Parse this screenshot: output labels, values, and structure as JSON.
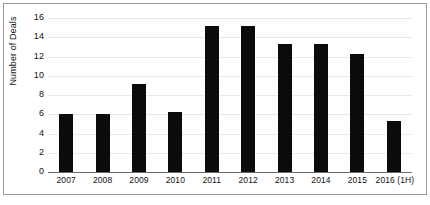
{
  "chart_data": {
    "type": "bar",
    "title": "",
    "xlabel": "",
    "ylabel": "Number of Deals",
    "categories": [
      "2007",
      "2008",
      "2009",
      "2010",
      "2011",
      "2012",
      "2013",
      "2014",
      "2015",
      "2016 (1H)"
    ],
    "values": [
      6,
      6,
      9.1,
      6.2,
      15.2,
      15.2,
      13.3,
      13.3,
      12.3,
      5.3
    ],
    "ylim": [
      0,
      16
    ],
    "ytick_labels": [
      "0",
      "2",
      "4",
      "6",
      "8",
      "10",
      "12",
      "14",
      "16"
    ],
    "ytick_values": [
      0,
      2,
      4,
      6,
      8,
      10,
      12,
      14,
      16
    ],
    "grid": true,
    "legend": "none",
    "bar_color": "#0b0b0b",
    "gridline_color": "#e9e9e9",
    "axis_color": "#6f6f6f",
    "background": "#ffffff"
  }
}
